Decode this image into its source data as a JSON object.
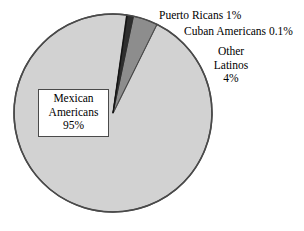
{
  "chart_data": {
    "type": "pie",
    "title": "",
    "subtitle": "",
    "xlabel": "",
    "ylabel": "",
    "legend_position": "none",
    "grid": false,
    "categories": [
      "Mexican Americans",
      "Puerto Ricans",
      "Cuban Americans",
      "Other Latinos"
    ],
    "values": [
      95,
      1,
      0.1,
      4
    ],
    "value_labels": [
      "95%",
      "1%",
      "0.1%",
      "4%"
    ],
    "units": "percent",
    "start_angle_deg": 8,
    "direction": "clockwise",
    "slices": [
      {
        "name": "Puerto Ricans",
        "value": 1,
        "value_label": "1%",
        "color": "#2e2e2e",
        "label_placement": "outside-right"
      },
      {
        "name": "Cuban Americans",
        "value": 0.1,
        "value_label": "0.1%",
        "color": "#111111",
        "label_placement": "outside-right"
      },
      {
        "name": "Other Latinos",
        "value": 4,
        "value_label": "4%",
        "color": "#8d8d8d",
        "label_placement": "outside-right"
      },
      {
        "name": "Mexican Americans",
        "value": 95,
        "value_label": "95%",
        "color": "#d2d2d2",
        "label_placement": "inside-box"
      }
    ]
  },
  "labels": {
    "puerto_ricans": "Puerto Ricans 1%",
    "cuban_americans": "Cuban Americans 0.1%",
    "other_latinos_line1": "Other",
    "other_latinos_line2": "Latinos",
    "other_latinos_line3": "4%",
    "mexican_line1": "Mexican",
    "mexican_line2": "Americans",
    "mexican_line3": "95%"
  },
  "colors": {
    "background": "#ffffff",
    "pie_outline": "#4a4a4a",
    "slice_mexican": "#d2d2d2",
    "slice_other_latinos": "#8d8d8d",
    "slice_puerto_ricans": "#2e2e2e",
    "slice_cuban_americans": "#111111",
    "box_border": "#4a4a4a",
    "box_fill": "#ffffff",
    "text": "#000000"
  }
}
